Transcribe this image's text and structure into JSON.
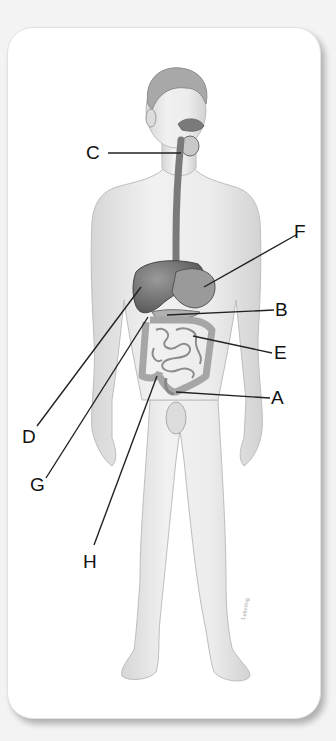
{
  "diagram": {
    "labels": [
      {
        "id": "A",
        "text": "A",
        "x": 271,
        "y": 389
      },
      {
        "id": "B",
        "text": "B",
        "x": 275,
        "y": 300
      },
      {
        "id": "C",
        "text": "C",
        "x": 87,
        "y": 143
      },
      {
        "id": "D",
        "text": "D",
        "x": 22,
        "y": 427
      },
      {
        "id": "E",
        "text": "E",
        "x": 274,
        "y": 343
      },
      {
        "id": "F",
        "text": "F",
        "x": 294,
        "y": 223
      },
      {
        "id": "G",
        "text": "G",
        "x": 30,
        "y": 475
      },
      {
        "id": "H",
        "text": "H",
        "x": 83,
        "y": 552
      }
    ],
    "leader_lines": [
      {
        "label": "C",
        "x1": 108,
        "y1": 153,
        "x2": 181,
        "y2": 153
      },
      {
        "label": "F",
        "x1": 296,
        "y1": 235,
        "x2": 204,
        "y2": 287
      },
      {
        "label": "B",
        "x1": 274,
        "y1": 310,
        "x2": 167,
        "y2": 315
      },
      {
        "label": "E",
        "x1": 272,
        "y1": 353,
        "x2": 193,
        "y2": 336
      },
      {
        "label": "A",
        "x1": 270,
        "y1": 398,
        "x2": 176,
        "y2": 392
      },
      {
        "label": "D",
        "x1": 37,
        "y1": 426,
        "x2": 141,
        "y2": 287
      },
      {
        "label": "G",
        "x1": 46,
        "y1": 478,
        "x2": 148,
        "y2": 317
      },
      {
        "label": "H",
        "x1": 94,
        "y1": 545,
        "x2": 157,
        "y2": 376
      }
    ],
    "colors": {
      "background": "#f3f3f3",
      "card": "#ffffff",
      "skin": "#ececec",
      "skin_shade": "#d4d4d4",
      "organ": "#8a8a8a",
      "organ_dark": "#5e5e5e",
      "intestine": "#c2c2c2",
      "line": "#222222"
    }
  }
}
